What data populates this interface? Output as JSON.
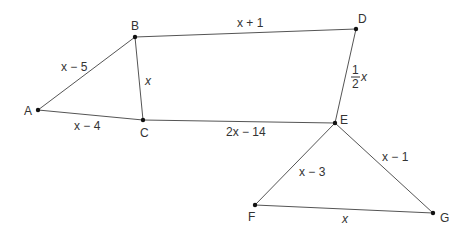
{
  "diagram": {
    "points": [
      {
        "id": "A",
        "label": "A",
        "x": 38,
        "y": 110,
        "lx": 24,
        "ly": 115
      },
      {
        "id": "B",
        "label": "B",
        "x": 135,
        "y": 37,
        "lx": 130,
        "ly": 30
      },
      {
        "id": "C",
        "label": "C",
        "x": 143,
        "y": 120,
        "lx": 139,
        "ly": 137
      },
      {
        "id": "D",
        "label": "D",
        "x": 356,
        "y": 29,
        "lx": 358,
        "ly": 23
      },
      {
        "id": "E",
        "label": "E",
        "x": 335,
        "y": 123,
        "lx": 341,
        "ly": 124
      },
      {
        "id": "F",
        "label": "F",
        "x": 255,
        "y": 205,
        "lx": 248,
        "ly": 222
      },
      {
        "id": "G",
        "label": "G",
        "x": 433,
        "y": 213,
        "lx": 440,
        "ly": 222
      }
    ],
    "segments": [
      {
        "from": "A",
        "to": "B",
        "label": "x − 5"
      },
      {
        "from": "B",
        "to": "C",
        "label": "x"
      },
      {
        "from": "A",
        "to": "C",
        "label": "x − 4"
      },
      {
        "from": "B",
        "to": "D",
        "label": "x + 1"
      },
      {
        "from": "D",
        "to": "E",
        "label": "1/2 x"
      },
      {
        "from": "C",
        "to": "E",
        "label": "2x − 14"
      },
      {
        "from": "E",
        "to": "F",
        "label": "x − 3"
      },
      {
        "from": "E",
        "to": "G",
        "label": "x − 1"
      },
      {
        "from": "F",
        "to": "G",
        "label": "x"
      }
    ],
    "labels": {
      "AB": "x − 5",
      "BC": "x",
      "AC": "x − 4",
      "BD": "x + 1",
      "DE_num": "1",
      "DE_den": "2",
      "DE_var": "x",
      "CE": "2x − 14",
      "EF": "x − 3",
      "EG": "x − 1",
      "FG": "x"
    },
    "point_labels": {
      "A": "A",
      "B": "B",
      "C": "C",
      "D": "D",
      "E": "E",
      "F": "F",
      "G": "G"
    }
  }
}
